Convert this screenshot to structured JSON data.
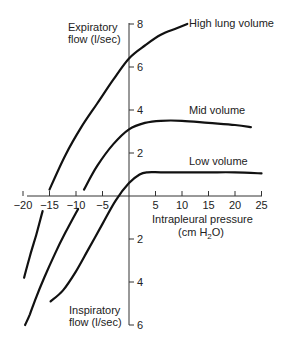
{
  "chart_data": {
    "type": "line",
    "title": "",
    "xlabel": "Intrapleural pressure",
    "xlabel_units": "(cm H2O)",
    "ylabel_top": [
      "Expiratory",
      "flow (l/sec)"
    ],
    "ylabel_bottom": [
      "Inspiratory",
      "flow (l/sec)"
    ],
    "xlim": [
      -20,
      25
    ],
    "ylim": [
      -6,
      8
    ],
    "x_ticks": [
      -20,
      -15,
      -10,
      -5,
      5,
      10,
      15,
      20,
      25
    ],
    "x_tick_labels": [
      "−20",
      "−15",
      "−10",
      "−5",
      "5",
      "10",
      "15",
      "20",
      "25"
    ],
    "y_ticks_expiratory": [
      2,
      4,
      6,
      8
    ],
    "y_ticks_inspiratory": [
      -2,
      -4,
      -6
    ],
    "y_tick_labels": {
      "8": "8",
      "6": "6",
      "4": "4",
      "2": "2",
      "-2": "2",
      "-4": "4",
      "-6": "6"
    },
    "grid": false,
    "series": [
      {
        "name": "High lung volume",
        "segments": [
          {
            "x": [
              -15.0,
              -12,
              -9,
              -6,
              -3,
              0,
              3,
              6,
              9,
              11.0
            ],
            "y": [
              0.3,
              1.9,
              3.2,
              4.3,
              5.4,
              6.4,
              7.0,
              7.5,
              7.8,
              8.0
            ]
          },
          {
            "x": [
              -16.3,
              -17.5,
              -18.7,
              -19.8
            ],
            "y": [
              -0.7,
              -1.8,
              -2.8,
              -3.8
            ]
          }
        ],
        "label_pos": [
          11.0,
          8.0
        ]
      },
      {
        "name": "Mid volume",
        "segments": [
          {
            "x": [
              -8.5,
              -6,
              -3,
              0,
              3,
              6,
              10,
              15,
              20,
              23.0
            ],
            "y": [
              0.3,
              1.4,
              2.4,
              3.1,
              3.4,
              3.5,
              3.5,
              3.4,
              3.3,
              3.2
            ]
          },
          {
            "x": [
              -9.6,
              -12,
              -14,
              -16,
              -17.5,
              -18.7,
              -19.6
            ],
            "y": [
              -0.6,
              -1.7,
              -2.7,
              -3.8,
              -4.7,
              -5.5,
              -6.0
            ]
          }
        ],
        "label_pos": [
          10.0,
          3.7
        ]
      },
      {
        "name": "Low volume",
        "segments": [
          {
            "x": [
              -14.8,
              -12.5,
              -10,
              -7.5,
              -5,
              -2.5,
              0,
              2,
              3.5,
              6,
              10,
              15,
              20,
              25
            ],
            "y": [
              -4.9,
              -4.4,
              -3.5,
              -2.4,
              -1.3,
              -0.2,
              0.6,
              1.0,
              1.1,
              1.1,
              1.1,
              1.1,
              1.1,
              1.05
            ]
          }
        ],
        "label_pos": [
          10.0,
          1.3
        ]
      }
    ]
  },
  "labels": {
    "y_top_1": "Expiratory",
    "y_top_2": "flow (l/sec)",
    "y_bottom_1": "Inspiratory",
    "y_bottom_2": "flow (l/sec)",
    "x_label_1": "Intrapleural pressure",
    "x_label_2_prefix": "(cm H",
    "x_label_2_sub": "2",
    "x_label_2_suffix": "O)",
    "series_high": "High lung volume",
    "series_mid": "Mid volume",
    "series_low": "Low volume"
  }
}
